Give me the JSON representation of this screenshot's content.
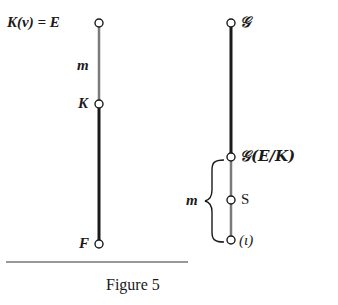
{
  "figure": {
    "caption": "Figure 5",
    "left_tower": {
      "nodes": [
        {
          "label": "K(v) = E",
          "y": 23
        },
        {
          "label": "K",
          "y": 104
        },
        {
          "label": "F",
          "y": 244
        }
      ],
      "segment_labels": [
        {
          "label": "m",
          "between": [
            "K(v) = E",
            "K"
          ]
        }
      ]
    },
    "right_tower": {
      "nodes": [
        {
          "label": "𝒢",
          "y": 23
        },
        {
          "label": "𝒢(E/K)",
          "y": 157
        },
        {
          "label": "S",
          "y": 200
        },
        {
          "label": "(ι)",
          "y": 240
        }
      ],
      "brace_label": "m"
    }
  },
  "colors": {
    "thin_line": "#7a7a7a",
    "thick_line": "#1a1a1a"
  }
}
